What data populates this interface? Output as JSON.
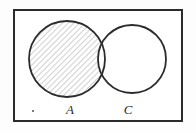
{
  "figure": {
    "type": "venn-diagram",
    "background_color": "#fdfdfd",
    "stroke_color": "#2b2b2b",
    "hatch_color": "#8a8a8a",
    "universe_box": {
      "x": 13,
      "y": 9,
      "width": 170,
      "height": 113,
      "border_width": 2,
      "fill": "#ffffff"
    },
    "circles": [
      {
        "id": "A",
        "label": "A",
        "cx": 67,
        "cy": 59,
        "r": 38,
        "shaded": true,
        "stroke_width": 1.8
      },
      {
        "id": "C",
        "label": "C",
        "cx": 132,
        "cy": 59,
        "r": 34,
        "shaded": false,
        "stroke_width": 1.8
      }
    ],
    "shaded_region_description": "A minus C",
    "hatch": {
      "angle_degrees": 45,
      "spacing_px": 4,
      "line_width": 0.8
    },
    "labels": [
      {
        "text": "A",
        "x": 70,
        "y": 114
      },
      {
        "text": "C",
        "x": 128,
        "y": 114
      }
    ],
    "marks": [
      {
        "name": "stray-dot",
        "x": 33,
        "y": 111,
        "r": 1.1
      }
    ]
  }
}
